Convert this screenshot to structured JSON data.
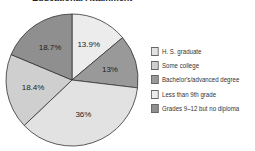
{
  "chart_data": {
    "type": "pie",
    "title": "Educational Attainment",
    "slices": [
      {
        "label": "Less than 9th grade",
        "value": 13.9,
        "display": "13.9%",
        "color": "#ececec"
      },
      {
        "label": "Bachelor's/advanced degree",
        "value": 13,
        "display": "13%",
        "color": "#999999"
      },
      {
        "label": "H. S. graduate",
        "value": 36,
        "display": "36%",
        "color": "#e2e2e2"
      },
      {
        "label": "Some college",
        "value": 18.4,
        "display": "18.4%",
        "color": "#cfcfcf"
      },
      {
        "label": "Grades 9–12 but no diploma",
        "value": 18.7,
        "display": "18.7%",
        "color": "#8f8f8f"
      }
    ],
    "legend": [
      {
        "label": "H. S. graduate",
        "color": "#e2e2e2"
      },
      {
        "label": "Some college",
        "color": "#cfcfcf"
      },
      {
        "label": "Bachelor's/advanced degree",
        "color": "#999999"
      },
      {
        "label": "Less than 9th grade",
        "color": "#ececec"
      },
      {
        "label": "Grades 9–12 but no diploma",
        "color": "#8f8f8f"
      }
    ],
    "legend_position": "right"
  }
}
